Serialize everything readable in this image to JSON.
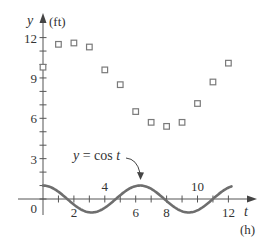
{
  "chart_data": {
    "type": "scatter",
    "title": "",
    "xlabel": "t",
    "xunit": "(h)",
    "ylabel": "y",
    "yunit": "(ft)",
    "xlim": [
      0,
      13.5
    ],
    "ylim": [
      -1.5,
      13
    ],
    "grid": false,
    "x_ticks": [
      0,
      1,
      2,
      3,
      4,
      5,
      6,
      7,
      8,
      9,
      10,
      11,
      12
    ],
    "x_tick_labels": [
      {
        "value": 2,
        "label": "2",
        "position": "below"
      },
      {
        "value": 4,
        "label": "4",
        "position": "above"
      },
      {
        "value": 6,
        "label": "6",
        "position": "below"
      },
      {
        "value": 8,
        "label": "8",
        "position": "below"
      },
      {
        "value": 10,
        "label": "10",
        "position": "above"
      },
      {
        "value": 12,
        "label": "12",
        "position": "below"
      }
    ],
    "y_ticks": [
      0,
      1,
      2,
      3,
      4,
      5,
      6,
      7,
      8,
      9,
      10,
      11,
      12
    ],
    "y_tick_labels": [
      {
        "value": 0,
        "label": "0"
      },
      {
        "value": 3,
        "label": "3"
      },
      {
        "value": 6,
        "label": "6"
      },
      {
        "value": 9,
        "label": "9"
      },
      {
        "value": 12,
        "label": "12"
      }
    ],
    "series": [
      {
        "name": "data",
        "marker": "open-square",
        "x": [
          0,
          1,
          2,
          3,
          4,
          5,
          6,
          7,
          8,
          9,
          10,
          11,
          12
        ],
        "y": [
          9.8,
          11.5,
          11.6,
          11.3,
          9.6,
          8.5,
          6.5,
          5.7,
          5.4,
          5.7,
          7.1,
          8.7,
          10.1
        ]
      },
      {
        "name": "y = cos t",
        "type": "line",
        "function": "cos",
        "x_range": [
          0,
          12.2
        ]
      }
    ],
    "annotations": [
      {
        "text": "y = cos t",
        "arrow_to": {
          "x": 6.3,
          "y": 1
        }
      }
    ]
  },
  "labels": {
    "y_axis_var": "y",
    "y_axis_unit": "(ft)",
    "x_axis_var": "t",
    "x_axis_unit": "(h)",
    "curve_label_prefix": "y",
    "curve_label_rest": " = cos ",
    "curve_label_var": "t",
    "origin": "0"
  }
}
